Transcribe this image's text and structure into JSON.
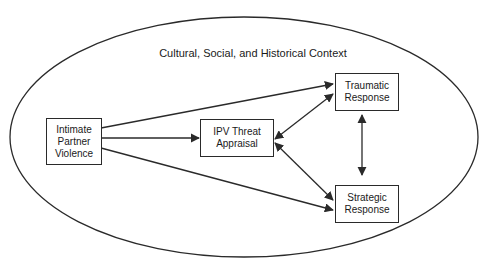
{
  "context": {
    "label": "Cultural, Social, and Historical Context"
  },
  "nodes": {
    "ipv": {
      "line1": "Intimate",
      "line2": "Partner",
      "line3": "Violence"
    },
    "appraisal": {
      "line1": "IPV Threat",
      "line2": "Appraisal"
    },
    "traumatic": {
      "line1": "Traumatic",
      "line2": "Response"
    },
    "strategic": {
      "line1": "Strategic",
      "line2": "Response"
    }
  },
  "edges": [
    {
      "from": "Intimate Partner Violence",
      "to": "Traumatic Response",
      "type": "directed"
    },
    {
      "from": "Intimate Partner Violence",
      "to": "IPV Threat Appraisal",
      "type": "directed"
    },
    {
      "from": "Intimate Partner Violence",
      "to": "Strategic Response",
      "type": "directed"
    },
    {
      "from": "IPV Threat Appraisal",
      "to": "Traumatic Response",
      "type": "bidirectional"
    },
    {
      "from": "IPV Threat Appraisal",
      "to": "Strategic Response",
      "type": "bidirectional"
    },
    {
      "from": "Traumatic Response",
      "to": "Strategic Response",
      "type": "bidirectional"
    }
  ],
  "colors": {
    "stroke": "#2a2a2a",
    "background": "#ffffff"
  }
}
